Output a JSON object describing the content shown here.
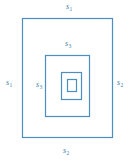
{
  "figure": {
    "type": "nested-rectangle-spiral-diagram",
    "background_color": "#ffffff",
    "stroke_color": "#4a8fc0",
    "label_color": "#3d7fae",
    "labels": [
      {
        "id": "s1-top",
        "base": "s",
        "subscript": "1",
        "position": "outer-top"
      },
      {
        "id": "s1-left",
        "base": "s",
        "subscript": "1",
        "position": "outer-left"
      },
      {
        "id": "s2-right",
        "base": "s",
        "subscript": "2",
        "position": "outer-right"
      },
      {
        "id": "s2-bottom",
        "base": "s",
        "subscript": "2",
        "position": "outer-bottom"
      },
      {
        "id": "s3-top",
        "base": "s",
        "subscript": "3",
        "position": "middle-top"
      },
      {
        "id": "s3-left",
        "base": "s",
        "subscript": "3",
        "position": "middle-left"
      }
    ],
    "rings": [
      {
        "name": "outer-rectangle",
        "x": 22.5,
        "y": 18.5,
        "width": 90.0,
        "height": 119.0
      },
      {
        "name": "middle-rectangle",
        "x": 45.5,
        "y": 55.5,
        "width": 44.0,
        "height": 61.0
      },
      {
        "name": "inner-rectangle",
        "x": 61.5,
        "y": 72.5,
        "width": 20.0,
        "height": 27.0
      },
      {
        "name": "innermost-rectangle",
        "x": 67.5,
        "y": 79.5,
        "width": 9.0,
        "height": 12.0
      }
    ]
  }
}
